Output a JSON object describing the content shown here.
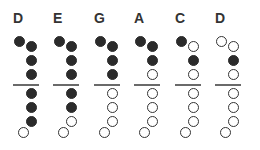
{
  "legend": {
    "closed": "filled hole",
    "open": "open hole"
  },
  "colors": {
    "closed": "#2b2b2b",
    "open_fill": "#ffffff",
    "line": "#6a6a6a",
    "text": "#333333"
  },
  "notes": [
    {
      "label": "D",
      "holes": [
        "closed",
        "closed",
        "closed",
        "closed",
        "closed",
        "closed",
        "closed",
        "open"
      ]
    },
    {
      "label": "E",
      "holes": [
        "closed",
        "closed",
        "closed",
        "closed",
        "closed",
        "closed",
        "open",
        "open"
      ]
    },
    {
      "label": "G",
      "holes": [
        "closed",
        "closed",
        "closed",
        "closed",
        "open",
        "open",
        "open",
        "open"
      ]
    },
    {
      "label": "A",
      "holes": [
        "closed",
        "closed",
        "closed",
        "open",
        "open",
        "open",
        "open",
        "open"
      ]
    },
    {
      "label": "C",
      "holes": [
        "closed",
        "open",
        "closed",
        "open",
        "open",
        "open",
        "open",
        "open"
      ]
    },
    {
      "label": "D",
      "holes": [
        "open",
        "open",
        "closed",
        "open",
        "open",
        "open",
        "open",
        "open"
      ]
    }
  ]
}
